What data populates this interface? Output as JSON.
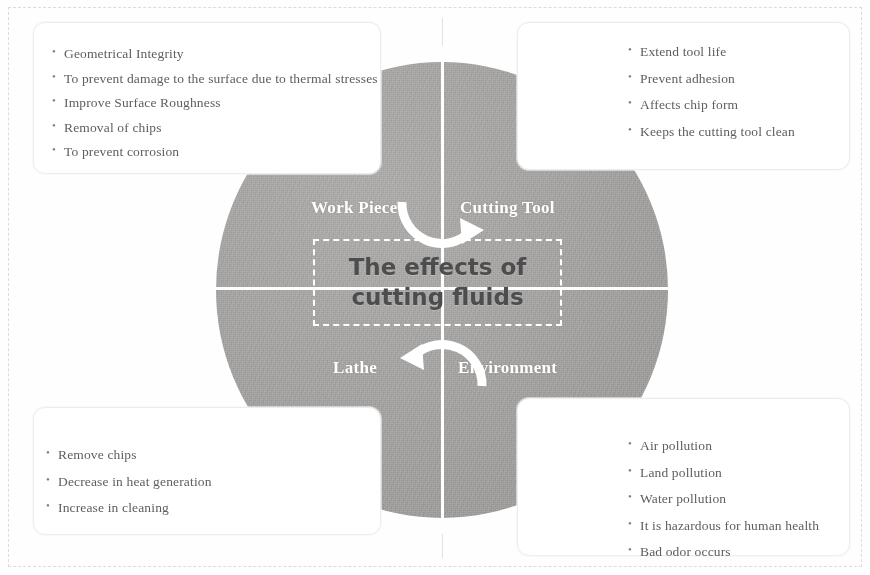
{
  "diagram": {
    "title_line_1": "The effects of",
    "title_line_2": "cutting fluids",
    "circle_color": "#a2a1a0",
    "divider_color": "#ffffff",
    "quadrant_labels": {
      "top_left": "Work Piece",
      "top_right": "Cutting Tool",
      "bottom_left": "Lathe",
      "bottom_right": "Environment"
    },
    "arrows": [
      {
        "name": "top-clockwise-arrow",
        "direction": "clockwise"
      },
      {
        "name": "bottom-clockwise-arrow",
        "direction": "clockwise"
      }
    ]
  },
  "cards": {
    "work_piece": {
      "name": "work-piece-effects",
      "items": [
        "Geometrical Integrity",
        "To prevent damage to the surface due to thermal stresses",
        "Improve Surface Roughness",
        "Removal of chips",
        "To prevent corrosion"
      ]
    },
    "cutting_tool": {
      "name": "cutting-tool-effects",
      "items": [
        "Extend tool life",
        "Prevent adhesion",
        "Affects chip form",
        "Keeps the cutting tool clean"
      ]
    },
    "lathe": {
      "name": "lathe-effects",
      "items": [
        "Remove chips",
        "Decrease in heat generation",
        "Increase in cleaning"
      ]
    },
    "environment": {
      "name": "environment-effects",
      "items": [
        "Air pollution",
        "Land pollution",
        "Water pollution",
        "It is hazardous for human health",
        "Bad odor occurs"
      ]
    }
  }
}
